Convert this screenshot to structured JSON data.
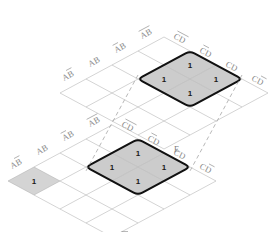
{
  "diagram": {
    "type": "karnaugh-map",
    "colors": {
      "grid_line": "#b0b0b0",
      "group_outline": "#111111",
      "group_fill": "#cccccc",
      "label_text": "#8a8a8a",
      "cell_text": "#1a1a1a",
      "dashed_line": "#9a9a9a",
      "background": "#ffffff"
    },
    "planes": [
      {
        "id": "top-plane",
        "plane_label": "E",
        "plane_label_overbar": false,
        "ab_labels": [
          {
            "text": "AB",
            "overbar": "b"
          },
          {
            "text": "AB",
            "overbar": "none"
          },
          {
            "text": "AB",
            "overbar": "a"
          },
          {
            "text": "AB",
            "overbar": "both"
          }
        ],
        "cd_labels": [
          {
            "text": "CD",
            "overbar": "both"
          },
          {
            "text": "CD",
            "overbar": "c"
          },
          {
            "text": "CD",
            "overbar": "none"
          },
          {
            "text": "CD",
            "overbar": "d"
          }
        ],
        "ones": [
          {
            "row": 0,
            "col": 1,
            "value": "1"
          },
          {
            "row": 1,
            "col": 0,
            "value": "1"
          },
          {
            "row": 1,
            "col": 2,
            "value": "1"
          },
          {
            "row": 2,
            "col": 1,
            "value": "1"
          }
        ],
        "groups": [
          {
            "id": "top-group",
            "shape": "diamond-4cell",
            "cells": 4,
            "style": "bold-rounded"
          }
        ]
      },
      {
        "id": "bottom-plane",
        "plane_label": "E",
        "plane_label_overbar": true,
        "ab_labels": [
          {
            "text": "AB",
            "overbar": "b"
          },
          {
            "text": "AB",
            "overbar": "none"
          },
          {
            "text": "AB",
            "overbar": "a"
          },
          {
            "text": "AB",
            "overbar": "both"
          }
        ],
        "cd_labels": [
          {
            "text": "CD",
            "overbar": "both"
          },
          {
            "text": "CD",
            "overbar": "c"
          },
          {
            "text": "CD",
            "overbar": "none"
          },
          {
            "text": "CD",
            "overbar": "d"
          }
        ],
        "ones": [
          {
            "row": 0,
            "col": 1,
            "value": "1"
          },
          {
            "row": 1,
            "col": 0,
            "value": "1"
          },
          {
            "row": 1,
            "col": 2,
            "value": "1"
          },
          {
            "row": 2,
            "col": 1,
            "value": "1"
          },
          {
            "row": 1,
            "col": -3,
            "value": "1"
          }
        ],
        "groups": [
          {
            "id": "bottom-group",
            "shape": "diamond-4cell",
            "cells": 4,
            "style": "bold-rounded"
          },
          {
            "id": "bottom-single",
            "shape": "single-cell",
            "cells": 1,
            "style": "shaded"
          }
        ]
      }
    ],
    "connectors": [
      {
        "id": "left-connector",
        "style": "dashed",
        "orientation": "vertical"
      },
      {
        "id": "right-connector",
        "style": "dashed",
        "orientation": "vertical"
      }
    ]
  }
}
